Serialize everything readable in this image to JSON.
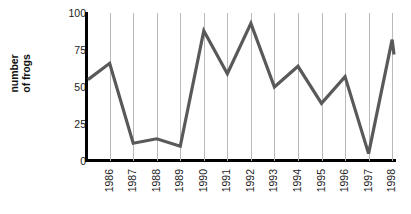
{
  "chart_data": {
    "type": "line",
    "title": "",
    "xlabel": "",
    "ylabel": "number of frogs",
    "ylabel_lines": [
      "number",
      "of frogs"
    ],
    "categories": [
      "1986",
      "1987",
      "1988",
      "1989",
      "1990",
      "1991",
      "1992",
      "1993",
      "1994",
      "1995",
      "1996",
      "1997",
      "1998"
    ],
    "values": [
      66,
      12,
      15,
      10,
      88,
      59,
      93,
      50,
      64,
      39,
      57,
      5,
      82
    ],
    "series": [
      {
        "name": "number of frogs",
        "values": [
          66,
          12,
          15,
          10,
          88,
          59,
          93,
          50,
          64,
          39,
          57,
          5,
          82
        ],
        "color": "#595959"
      }
    ],
    "line_start_value": 55,
    "line_end_value": 72,
    "ylim": [
      0,
      100
    ],
    "yticks": [
      0,
      25,
      50,
      75,
      100
    ],
    "ytick_labels": [
      "0",
      "25",
      "50",
      "75",
      "100"
    ],
    "grid": "vertical",
    "legend": "none",
    "axis_color": "#000000",
    "gridline_color": "#b9b9b9",
    "background": "#ffffff"
  }
}
